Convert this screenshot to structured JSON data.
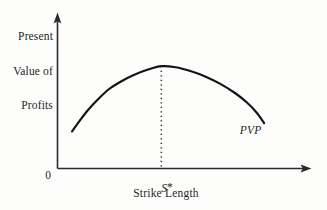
{
  "figure": {
    "background_color": "#fdfdfc",
    "ink_color": "#1a1a1a",
    "y_axis_label_line1": "Present",
    "y_axis_label_line2": "Value of",
    "y_axis_label_line3": "Profits",
    "x_axis_label": "Strike Length",
    "origin_label": "0",
    "optimum_tick_label": "S",
    "optimum_tick_star": "*",
    "curve_label": "PVP"
  },
  "chart_data": {
    "type": "line",
    "title": "",
    "subtitle": "",
    "xlabel": "Strike Length",
    "ylabel": "Present Value of Profits",
    "grid": false,
    "legend_position": "inline-right-end",
    "axis_style": {
      "x_axis_arrow": true,
      "y_axis_arrow": true,
      "tick_marks": false,
      "numeric_ticks": false
    },
    "xlim": [
      0,
      1
    ],
    "ylim": [
      0,
      1
    ],
    "x_tick_labels": [
      "0",
      "S*"
    ],
    "y_tick_labels": [],
    "annotations": [
      {
        "name": "optimum-dropline",
        "text": "",
        "style": "dotted-vertical",
        "x": 0.422,
        "y_from": 0.0,
        "y_to": 0.682
      },
      {
        "name": "curve-label",
        "text": "PVP",
        "x": 0.79,
        "y": 0.24,
        "italic": true
      },
      {
        "name": "optimum-label",
        "text": "S*",
        "x": 0.422,
        "y": -0.06,
        "italic": true
      }
    ],
    "series": [
      {
        "name": "PVP",
        "shape": "concave-down parabola",
        "color": "#141414",
        "linewidth": 2.2,
        "points": [
          {
            "x": 0.059,
            "y": 0.247
          },
          {
            "x": 0.09,
            "y": 0.318
          },
          {
            "x": 0.125,
            "y": 0.392
          },
          {
            "x": 0.165,
            "y": 0.462
          },
          {
            "x": 0.21,
            "y": 0.53
          },
          {
            "x": 0.26,
            "y": 0.582
          },
          {
            "x": 0.31,
            "y": 0.623
          },
          {
            "x": 0.365,
            "y": 0.658
          },
          {
            "x": 0.422,
            "y": 0.682
          },
          {
            "x": 0.48,
            "y": 0.675
          },
          {
            "x": 0.54,
            "y": 0.65
          },
          {
            "x": 0.6,
            "y": 0.614
          },
          {
            "x": 0.66,
            "y": 0.566
          },
          {
            "x": 0.72,
            "y": 0.505
          },
          {
            "x": 0.77,
            "y": 0.44
          },
          {
            "x": 0.81,
            "y": 0.372
          },
          {
            "x": 0.84,
            "y": 0.303
          }
        ]
      }
    ]
  }
}
